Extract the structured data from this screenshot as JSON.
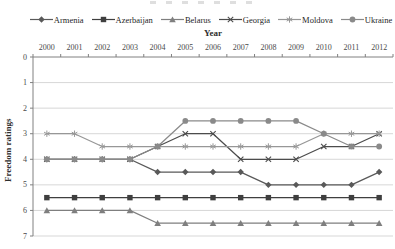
{
  "axes": {
    "x_title": "Year",
    "y_title": "Freedom ratings",
    "x_tick_labels": [
      "2000",
      "2001",
      "2002",
      "2003",
      "2004",
      "2005",
      "2006",
      "2007",
      "2008",
      "2009",
      "2010",
      "2011",
      "2012"
    ],
    "y_tick_labels": [
      "0",
      "1",
      "2",
      "3",
      "4",
      "5",
      "6",
      "7"
    ]
  },
  "colors": {
    "background": "#ffffff",
    "grid": "#d2d2d2",
    "axis": "#808080",
    "tick_label": "#4a4a4a",
    "legend_text": "#1f1f1f"
  },
  "chart_data": {
    "type": "line",
    "title": "",
    "xlabel": "Year",
    "ylabel": "Freedom ratings",
    "x": [
      2000,
      2001,
      2002,
      2003,
      2004,
      2005,
      2006,
      2007,
      2008,
      2009,
      2010,
      2011,
      2012
    ],
    "ylim": [
      0,
      7
    ],
    "y_axis_inverted": true,
    "grid": "horizontal",
    "legend_position": "top",
    "x_axis_position": "top",
    "series": [
      {
        "name": "Armenia",
        "marker": "diamond",
        "color": "#595959",
        "values": [
          4,
          4,
          4,
          4,
          4.5,
          4.5,
          4.5,
          4.5,
          5,
          5,
          5,
          5,
          4.5
        ]
      },
      {
        "name": "Azerbaijan",
        "marker": "square",
        "color": "#3f3f3f",
        "values": [
          5.5,
          5.5,
          5.5,
          5.5,
          5.5,
          5.5,
          5.5,
          5.5,
          5.5,
          5.5,
          5.5,
          5.5,
          5.5
        ]
      },
      {
        "name": "Belarus",
        "marker": "triangle",
        "color": "#7f7f7f",
        "values": [
          6,
          6,
          6,
          6,
          6.5,
          6.5,
          6.5,
          6.5,
          6.5,
          6.5,
          6.5,
          6.5,
          6.5
        ]
      },
      {
        "name": "Georgia",
        "marker": "x",
        "color": "#4c4c4c",
        "values": [
          4,
          4,
          4,
          4,
          3.5,
          3,
          3,
          4,
          4,
          4,
          3.5,
          3.5,
          3
        ]
      },
      {
        "name": "Moldova",
        "marker": "asterisk",
        "color": "#979797",
        "values": [
          3,
          3,
          3.5,
          3.5,
          3.5,
          3.5,
          3.5,
          3.5,
          3.5,
          3.5,
          3,
          3,
          3
        ]
      },
      {
        "name": "Ukraine",
        "marker": "circle",
        "color": "#8a8a8a",
        "values": [
          4,
          4,
          4,
          4,
          3.5,
          2.5,
          2.5,
          2.5,
          2.5,
          2.5,
          3,
          3.5,
          3.5
        ]
      }
    ]
  }
}
